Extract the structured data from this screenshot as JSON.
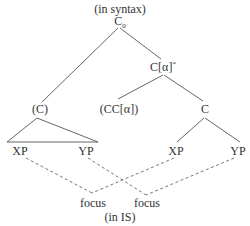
{
  "diagram": {
    "top_caption": "(in syntax)",
    "bottom_caption": "(in IS)",
    "nodes": {
      "root": {
        "label": "C",
        "subscript": "0"
      },
      "c_alpha": {
        "label": "C[α]",
        "superscript": "*"
      },
      "c_paren": {
        "label": "(C)"
      },
      "cc_alpha": {
        "label": "(CC[α])"
      },
      "c_right": {
        "label": "C"
      },
      "xp_left": {
        "label": "XP"
      },
      "yp_left": {
        "label": "YP"
      },
      "xp_right": {
        "label": "XP"
      },
      "yp_right": {
        "label": "YP"
      },
      "focus_left": {
        "label": "focus"
      },
      "focus_right": {
        "label": "focus"
      }
    },
    "edges": [
      {
        "from": "root",
        "to": "c_paren",
        "style": "solid"
      },
      {
        "from": "root",
        "to": "c_alpha",
        "style": "solid"
      },
      {
        "from": "c_alpha",
        "to": "cc_alpha",
        "style": "solid"
      },
      {
        "from": "c_alpha",
        "to": "c_right",
        "style": "solid"
      },
      {
        "from": "c_paren",
        "to": "xp_left/yp_left",
        "style": "triangle"
      },
      {
        "from": "c_right",
        "to": "xp_right",
        "style": "solid"
      },
      {
        "from": "c_right",
        "to": "yp_right",
        "style": "solid"
      },
      {
        "from": "xp_left",
        "to": "focus_left",
        "style": "dashed"
      },
      {
        "from": "xp_right",
        "to": "focus_left",
        "style": "dashed"
      },
      {
        "from": "yp_left",
        "to": "focus_right",
        "style": "dashed"
      },
      {
        "from": "yp_right",
        "to": "focus_right",
        "style": "dashed"
      }
    ],
    "colors": {
      "line": "#555555",
      "text": "#333333"
    }
  }
}
